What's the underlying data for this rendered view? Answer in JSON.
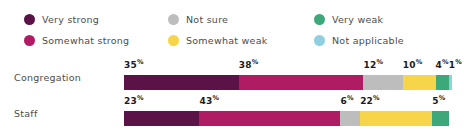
{
  "legend": {
    "items": [
      {
        "label": "Very strong",
        "color": "#5A1247",
        "key": "very-strong"
      },
      {
        "label": "Not sure",
        "color": "#BDBDBD",
        "key": "not-sure"
      },
      {
        "label": "Very weak",
        "color": "#3DA87A",
        "key": "very-weak"
      },
      {
        "label": "Somewhat strong",
        "color": "#B01C63",
        "key": "somewhat-strong"
      },
      {
        "label": "Somewhat weak",
        "color": "#F7D54A",
        "key": "somewhat-weak"
      },
      {
        "label": "Not applicable",
        "color": "#8FCFE0",
        "key": "not-applicable"
      }
    ]
  },
  "rows": [
    {
      "label": "Congregation",
      "segments": [
        {
          "series": "Very strong",
          "value": 35,
          "label": "35",
          "suffix": "%",
          "color": "#5A1247"
        },
        {
          "series": "Somewhat strong",
          "value": 38,
          "label": "38",
          "suffix": "%",
          "color": "#B01C63"
        },
        {
          "series": "Not sure",
          "value": 12,
          "label": "12",
          "suffix": "%",
          "color": "#BDBDBD"
        },
        {
          "series": "Somewhat weak",
          "value": 10,
          "label": "10",
          "suffix": "%",
          "color": "#F7D54A"
        },
        {
          "series": "Very weak",
          "value": 4,
          "label": "4",
          "suffix": "%",
          "color": "#3DA87A"
        },
        {
          "series": "Not applicable",
          "value": 1,
          "label": "1",
          "suffix": "%",
          "color": "#8FCFE0"
        }
      ]
    },
    {
      "label": "Staff",
      "segments": [
        {
          "series": "Very strong",
          "value": 23,
          "label": "23",
          "suffix": "%",
          "color": "#5A1247"
        },
        {
          "series": "Somewhat strong",
          "value": 43,
          "label": "43",
          "suffix": "%",
          "color": "#B01C63"
        },
        {
          "series": "Not sure",
          "value": 6,
          "label": "6",
          "suffix": "%",
          "color": "#BDBDBD"
        },
        {
          "series": "Somewhat weak",
          "value": 22,
          "label": "22",
          "suffix": "%",
          "color": "#F7D54A"
        },
        {
          "series": "Very weak",
          "value": 5,
          "label": "5",
          "suffix": "%",
          "color": "#3DA87A"
        }
      ]
    }
  ],
  "chart_data": {
    "type": "bar",
    "orientation": "horizontal",
    "stacked": true,
    "normalized": "percent",
    "title": "",
    "subtitle": "",
    "xlabel": "",
    "ylabel": "",
    "xlim": [
      0,
      100
    ],
    "grid": false,
    "legend_position": "top",
    "value_suffix": "%",
    "categories": [
      "Congregation",
      "Staff"
    ],
    "series": [
      {
        "name": "Very strong",
        "color": "#5A1247",
        "values": [
          35,
          23
        ]
      },
      {
        "name": "Somewhat strong",
        "color": "#B01C63",
        "values": [
          38,
          43
        ]
      },
      {
        "name": "Not sure",
        "color": "#BDBDBD",
        "values": [
          12,
          6
        ]
      },
      {
        "name": "Somewhat weak",
        "color": "#F7D54A",
        "values": [
          10,
          22
        ]
      },
      {
        "name": "Very weak",
        "color": "#3DA87A",
        "values": [
          4,
          5
        ]
      },
      {
        "name": "Not applicable",
        "color": "#8FCFE0",
        "values": [
          1,
          null
        ]
      }
    ],
    "data_labels": {
      "Congregation": [
        "35%",
        "38%",
        "12%",
        "10%",
        "4%",
        "1%"
      ],
      "Staff": [
        "23%",
        "43%",
        "6%",
        "22%",
        "5%"
      ]
    }
  }
}
